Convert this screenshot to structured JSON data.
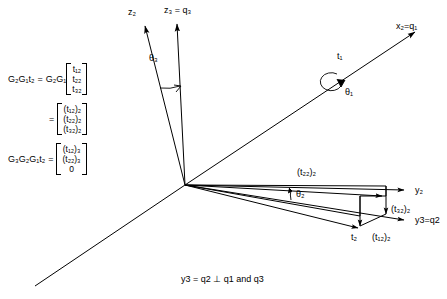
{
  "figure": {
    "type": "3d-vector-rotation-diagram",
    "caption": "y3 = q2 ⊥ q1 and q3",
    "background_color": "#ffffff",
    "line_color": "#000000"
  },
  "equations": [
    {
      "id": "eq1",
      "lhs": "G₂G₁t₂",
      "rel": "=",
      "pre": "G₂G₁",
      "vector": [
        "t₁₂",
        "t₂₂",
        "t₃₂"
      ]
    },
    {
      "id": "eq2",
      "lhs": "",
      "rel": "=",
      "pre": "",
      "vector": [
        "(t₁₂)₂",
        "(t₂₂)₂",
        "(t₃₂)₂"
      ]
    },
    {
      "id": "eq3",
      "lhs": "G₃G₂G₁t₂",
      "rel": "=",
      "pre": "",
      "vector": [
        "(t₁₂)₃",
        "(t₂₂)₃",
        "0"
      ]
    }
  ],
  "axis_labels": [
    {
      "id": "z2",
      "text": "z₂",
      "x": 128,
      "y": 8
    },
    {
      "id": "z3q3",
      "text": "z₃ = q₃",
      "x": 164,
      "y": 6
    },
    {
      "id": "x2q1",
      "text": "x₂=q₁",
      "x": 396,
      "y": 22
    },
    {
      "id": "y2",
      "text": "y₂",
      "x": 415,
      "y": 192
    },
    {
      "id": "y3q2",
      "text": "y3=q2",
      "x": 415,
      "y": 222
    }
  ],
  "angle_labels": [
    {
      "id": "theta3",
      "text": "θ₃",
      "x": 149,
      "y": 54
    },
    {
      "id": "theta1",
      "text": "θ₁",
      "x": 345,
      "y": 88
    },
    {
      "id": "theta2",
      "text": "θ₂",
      "x": 296,
      "y": 193
    }
  ],
  "vector_labels": [
    {
      "id": "t1",
      "text": "t₁",
      "x": 337,
      "y": 54
    },
    {
      "id": "t22_2",
      "text": "(t₂₂)₂",
      "x": 297,
      "y": 170
    },
    {
      "id": "t32_2",
      "text": "(t₃₂)₂",
      "x": 391,
      "y": 209
    },
    {
      "id": "t2",
      "text": "t₂",
      "x": 357,
      "y": 236
    },
    {
      "id": "t12_2",
      "text": "(t₁₂)₂",
      "x": 376,
      "y": 238
    }
  ],
  "geometry": {
    "origin": {
      "x": 185,
      "y": 185
    },
    "rays": [
      {
        "id": "z2-axis",
        "to": {
          "x": 143,
          "y": 22
        },
        "arrow": true
      },
      {
        "id": "z3-axis",
        "to": {
          "x": 176,
          "y": 20
        },
        "arrow": true
      },
      {
        "id": "x2-axis",
        "to": {
          "x": 418,
          "y": 30
        },
        "arrow": true
      },
      {
        "id": "lower-left",
        "to": {
          "x": 35,
          "y": 286
        },
        "arrow": false
      },
      {
        "id": "y2-axis",
        "to": {
          "x": 408,
          "y": 190
        },
        "arrow": true
      },
      {
        "id": "y3-axis",
        "to": {
          "x": 408,
          "y": 220
        },
        "arrow": true
      },
      {
        "id": "t22-edge",
        "to": {
          "x": 386,
          "y": 196
        },
        "arrow": true
      },
      {
        "id": "t2-vector",
        "to": {
          "x": 362,
          "y": 228
        },
        "arrow": true
      },
      {
        "id": "box-edge-top",
        "to": {
          "x": 386,
          "y": 185
        },
        "arrow": false
      },
      {
        "id": "box-edge-bot",
        "to": {
          "x": 362,
          "y": 214
        },
        "arrow": false
      }
    ]
  }
}
